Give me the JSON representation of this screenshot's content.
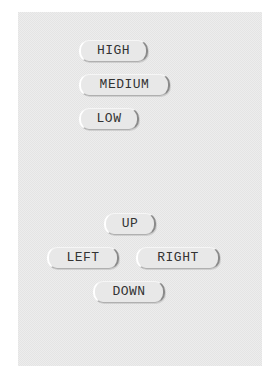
{
  "level_buttons": [
    {
      "label": "HIGH"
    },
    {
      "label": "MEDIUM"
    },
    {
      "label": "LOW"
    }
  ],
  "direction_buttons": {
    "up": "UP",
    "left": "LEFT",
    "right": "RIGHT",
    "down": "DOWN"
  },
  "colors": {
    "panel_bg": "#e4e4e4",
    "button_bg": "#e8e8e8",
    "text": "#333333"
  }
}
